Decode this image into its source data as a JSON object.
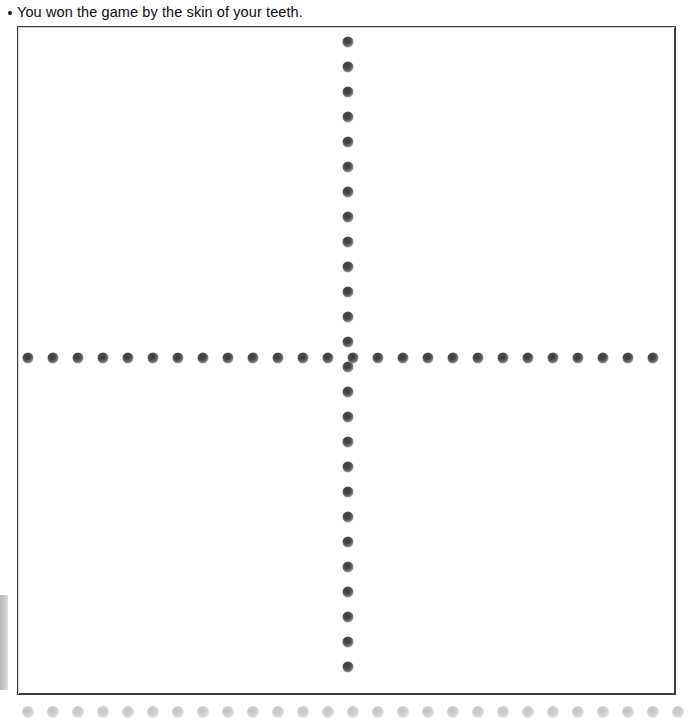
{
  "page": {
    "width": 694,
    "height": 724,
    "background_color": "#ffffff"
  },
  "caption": {
    "bullet": "•",
    "text": "You won the game by the skin of your teeth.",
    "color": "#0d0d0d"
  },
  "answer_box": {
    "label": "blank answer area",
    "border_color": "#3c3c3c",
    "fill_color": "#ffffff",
    "left": 17,
    "top": 26,
    "width": 659,
    "height": 669
  },
  "left_margin_bar": {
    "label": "scan edge shadow",
    "color": "#c9c9c9",
    "left": 0,
    "top": 595,
    "width": 8,
    "height": 95
  },
  "dot_guides": {
    "dot_color_dark": "#4b4b4b",
    "dot_color_faded": "#cfcfcf",
    "spacing": 25,
    "vertical_column": {
      "name": "vertical-dot-column",
      "x": 348,
      "start_y": 42,
      "count": 26,
      "style": "dark"
    },
    "horizontal_row": {
      "name": "horizontal-dot-row",
      "y": 358,
      "start_x": 28,
      "count": 26,
      "style": "dark"
    },
    "bottom_row": {
      "name": "bottom-faded-dot-row",
      "y": 712,
      "start_x": 28,
      "count": 27,
      "style": "faded"
    }
  }
}
